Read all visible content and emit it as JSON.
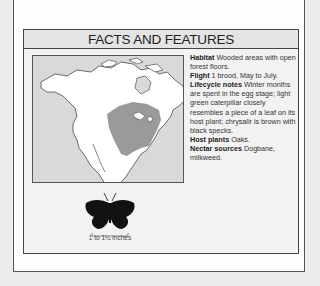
{
  "section": {
    "title": "FACTS AND FEATURES"
  },
  "facts": [
    {
      "label": "Habitat",
      "value": "Wooded areas with open forest floors."
    },
    {
      "label": "Flight",
      "value": "1 brood, May to July."
    },
    {
      "label": "Lifecycle notes",
      "value": "Winter months are spent in the egg stage; light green caterpillar closely resembles a piece of a leaf on its host plant; chrysalir is brown with black specks."
    },
    {
      "label": "Host plants",
      "value": "Oaks."
    },
    {
      "label": "Nectar sources",
      "value": "Dogbane, milkweed."
    }
  ],
  "map": {
    "icon": "range-map-north-america",
    "range_color": "#9a9a9a"
  },
  "size": {
    "icon": "butterfly-silhouette-icon",
    "caption": "1 to 1¼ inches"
  }
}
